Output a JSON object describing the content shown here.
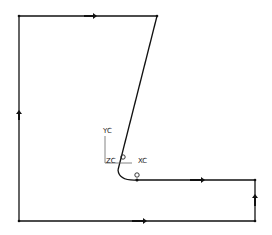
{
  "diagram": {
    "type": "cad-sketch-profile",
    "stroke_color": "#111111",
    "axes": {
      "x_label": "XC",
      "y_label": "YC",
      "z_label": "ZC"
    },
    "segments": [
      {
        "id": "top",
        "from": [
          19,
          16
        ],
        "to": [
          157,
          16
        ],
        "direction": "right"
      },
      {
        "id": "slant",
        "from": [
          157,
          16
        ],
        "to": [
          118,
          172
        ],
        "direction": "down"
      },
      {
        "id": "fillet",
        "from": [
          118,
          172
        ],
        "to": [
          137,
          180
        ],
        "direction": "arc"
      },
      {
        "id": "mid-horizontal",
        "from": [
          137,
          180
        ],
        "to": [
          255,
          180
        ],
        "direction": "right"
      },
      {
        "id": "right-vertical",
        "from": [
          255,
          221
        ],
        "to": [
          255,
          180
        ],
        "direction": "up"
      },
      {
        "id": "bottom",
        "from": [
          19,
          221
        ],
        "to": [
          255,
          221
        ],
        "direction": "right"
      },
      {
        "id": "left-vertical",
        "from": [
          19,
          221
        ],
        "to": [
          19,
          16
        ],
        "direction": "up"
      }
    ],
    "markers": [
      {
        "id": "circle-marker-1",
        "at": [
          124,
          157
        ]
      },
      {
        "id": "circle-marker-2",
        "at": [
          137,
          175
        ]
      }
    ]
  }
}
